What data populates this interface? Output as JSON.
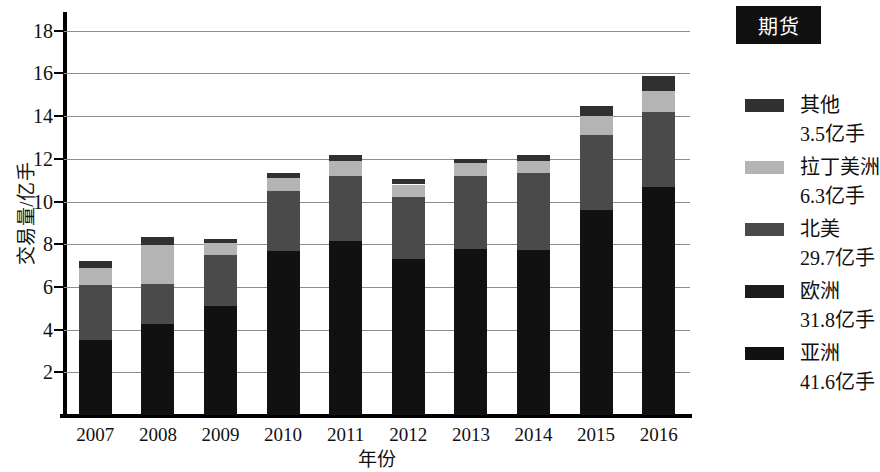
{
  "chart_data": {
    "type": "bar",
    "subtype": "stacked-bar",
    "title": "期货",
    "xlabel": "年份",
    "ylabel": "交易量/亿手",
    "categories": [
      "2007",
      "2008",
      "2009",
      "2010",
      "2011",
      "2012",
      "2013",
      "2014",
      "2015",
      "2016"
    ],
    "ylim": [
      0,
      18.6
    ],
    "yticks": [
      2,
      4,
      6,
      8,
      10,
      12,
      14,
      16,
      18
    ],
    "ytick_labels": [
      "2",
      "4",
      "6",
      "8",
      "10",
      "12",
      "14",
      "16",
      "18"
    ],
    "grid": true,
    "legend_position": "right",
    "stack_order_bottom_to_top": [
      "亚洲",
      "欧洲",
      "北美",
      "拉丁美洲",
      "其他"
    ],
    "series": [
      {
        "name": "亚洲",
        "legend_value": "41.6亿手",
        "color": "#111111",
        "values": [
          3.5,
          4.25,
          5.1,
          7.7,
          8.15,
          7.3,
          7.8,
          7.75,
          9.6,
          10.7
        ]
      },
      {
        "name": "欧洲",
        "legend_value": "31.8亿手",
        "color": "#1c1c1c",
        "values": [
          0.0,
          0.0,
          0.0,
          0.0,
          0.0,
          0.0,
          0.0,
          0.0,
          0.0,
          0.0
        ]
      },
      {
        "name": "北美",
        "legend_value": "29.7亿手",
        "color": "#4a4a4a",
        "values": [
          2.6,
          1.9,
          2.4,
          2.8,
          3.05,
          2.9,
          3.4,
          3.6,
          3.5,
          3.5
        ]
      },
      {
        "name": "拉丁美洲",
        "legend_value": "6.3亿手",
        "color": "#b4b4b4",
        "values": [
          0.8,
          1.8,
          0.55,
          0.6,
          0.7,
          0.6,
          0.6,
          0.55,
          0.9,
          1.0
        ]
      },
      {
        "name": "其他",
        "legend_value": "3.5亿手",
        "color": "#303030",
        "values": [
          0.3,
          0.4,
          0.2,
          0.25,
          0.3,
          0.25,
          0.2,
          0.3,
          0.5,
          0.7
        ]
      }
    ],
    "totals": [
      7.2,
      8.35,
      8.25,
      11.35,
      12.2,
      11.05,
      12.0,
      12.2,
      14.5,
      15.9
    ]
  },
  "legend": {
    "title": "期货",
    "entries": [
      {
        "label": "其他",
        "value": "3.5亿手",
        "color": "#303030"
      },
      {
        "label": "拉丁美洲",
        "value": "6.3亿手",
        "color": "#b4b4b4"
      },
      {
        "label": "北美",
        "value": "29.7亿手",
        "color": "#4a4a4a"
      },
      {
        "label": "欧洲",
        "value": "31.8亿手",
        "color": "#1c1c1c"
      },
      {
        "label": "亚洲",
        "value": "41.6亿手",
        "color": "#111111"
      }
    ]
  }
}
